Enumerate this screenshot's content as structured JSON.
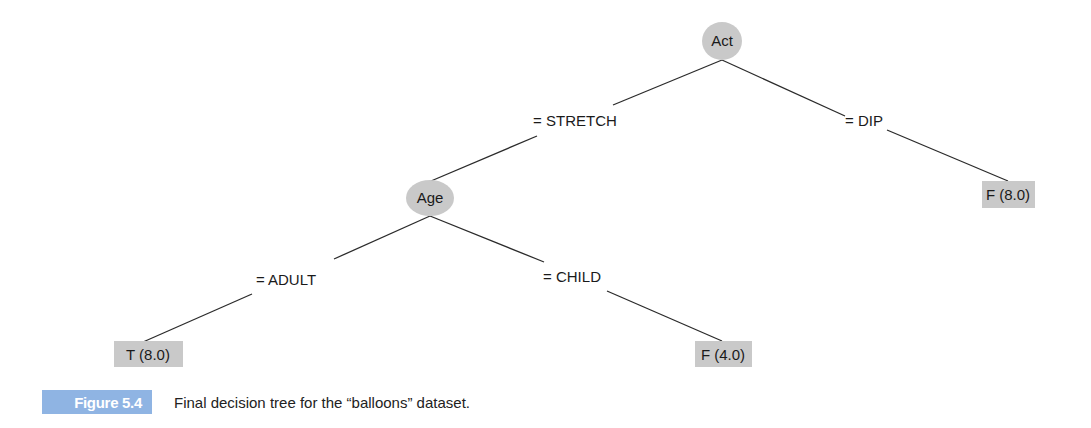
{
  "figure": {
    "label": "Figure 5.4",
    "caption": "Final decision tree for the “balloons” dataset.",
    "colors": {
      "node_fill": "#c9c9c9",
      "leaf_fill": "#c9c9c9",
      "edge_stroke": "#2b2b2b",
      "figure_label_bg": "#8fb4e3"
    }
  },
  "tree": {
    "root": {
      "label": "Act",
      "branches": [
        {
          "condition": "= STRETCH",
          "node": {
            "label": "Age",
            "branches": [
              {
                "condition": "= ADULT",
                "leaf": "T (8.0)"
              },
              {
                "condition": "= CHILD",
                "leaf": "F (4.0)"
              }
            ]
          }
        },
        {
          "condition": "= DIP",
          "leaf": "F (8.0)"
        }
      ]
    }
  },
  "nodes": {
    "act": "Act",
    "age": "Age"
  },
  "edges": {
    "stretch": "= STRETCH",
    "dip": "= DIP",
    "adult": "= ADULT",
    "child": "= CHILD"
  },
  "leaves": {
    "dip_false": "F (8.0)",
    "adult_true": "T (8.0)",
    "child_false": "F (4.0)"
  }
}
